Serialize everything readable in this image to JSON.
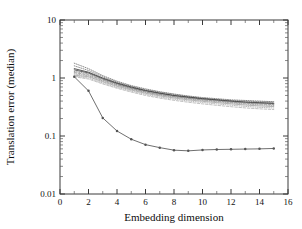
{
  "figure": {
    "background": "#ffffff",
    "frame_color": "#3a3a3a"
  },
  "chart_data": {
    "type": "line",
    "title": "",
    "subtitle": "",
    "xlabel": "Embedding dimension",
    "ylabel": "Translation error (median)",
    "xscale": "linear",
    "yscale": "log",
    "xlim": [
      0,
      16
    ],
    "ylim": [
      0.01,
      10
    ],
    "xticks": [
      0,
      2,
      4,
      6,
      8,
      10,
      12,
      14,
      16
    ],
    "xticklabels": [
      "0",
      "2",
      "4",
      "6",
      "8",
      "10",
      "12",
      "14",
      "16"
    ],
    "yticks": [
      0.01,
      0.1,
      1,
      10
    ],
    "yticklabels": [
      "0.01",
      "0.1",
      "1",
      "10"
    ],
    "grid": false,
    "legend": "none",
    "x": [
      1,
      2,
      3,
      4,
      5,
      6,
      7,
      8,
      9,
      10,
      11,
      12,
      13,
      14,
      15
    ],
    "series": [
      {
        "name": "baseline-1",
        "style": "dotted",
        "color": "#6e6e6e",
        "values": [
          1.8,
          1.45,
          1.1,
          0.88,
          0.74,
          0.65,
          0.58,
          0.53,
          0.49,
          0.46,
          0.44,
          0.42,
          0.41,
          0.4,
          0.39
        ]
      },
      {
        "name": "baseline-2",
        "style": "dotted",
        "color": "#757575",
        "values": [
          1.62,
          1.35,
          1.05,
          0.85,
          0.72,
          0.63,
          0.57,
          0.52,
          0.48,
          0.45,
          0.43,
          0.41,
          0.4,
          0.39,
          0.385
        ]
      },
      {
        "name": "baseline-3",
        "style": "solid",
        "color": "#2e2e2e",
        "values": [
          1.45,
          1.26,
          1.0,
          0.82,
          0.7,
          0.61,
          0.55,
          0.5,
          0.47,
          0.44,
          0.42,
          0.4,
          0.385,
          0.375,
          0.368
        ]
      },
      {
        "name": "baseline-4",
        "style": "solid",
        "color": "#3c3c3c",
        "values": [
          1.38,
          1.22,
          0.97,
          0.8,
          0.68,
          0.6,
          0.54,
          0.495,
          0.46,
          0.435,
          0.415,
          0.395,
          0.38,
          0.37,
          0.362
        ]
      },
      {
        "name": "baseline-5",
        "style": "dotted",
        "color": "#808080",
        "values": [
          1.3,
          1.18,
          0.95,
          0.78,
          0.665,
          0.585,
          0.525,
          0.485,
          0.452,
          0.428,
          0.408,
          0.39,
          0.375,
          0.365,
          0.357
        ]
      },
      {
        "name": "baseline-6",
        "style": "dashed",
        "color": "#8a8a8a",
        "values": [
          1.24,
          1.13,
          0.92,
          0.765,
          0.655,
          0.575,
          0.518,
          0.478,
          0.445,
          0.42,
          0.4,
          0.382,
          0.368,
          0.356,
          0.348
        ]
      },
      {
        "name": "baseline-7",
        "style": "dotted",
        "color": "#949494",
        "values": [
          1.18,
          1.09,
          0.89,
          0.745,
          0.64,
          0.563,
          0.508,
          0.468,
          0.435,
          0.41,
          0.39,
          0.372,
          0.356,
          0.344,
          0.336
        ]
      },
      {
        "name": "baseline-8",
        "style": "solid",
        "color": "#9e9e9e",
        "values": [
          1.12,
          1.05,
          0.86,
          0.72,
          0.62,
          0.545,
          0.492,
          0.452,
          0.42,
          0.396,
          0.376,
          0.358,
          0.342,
          0.33,
          0.322
        ]
      },
      {
        "name": "baseline-9",
        "style": "dotted",
        "color": "#a8a8a8",
        "values": [
          1.08,
          1.0,
          0.82,
          0.69,
          0.595,
          0.522,
          0.47,
          0.432,
          0.402,
          0.378,
          0.358,
          0.34,
          0.324,
          0.312,
          0.304
        ]
      },
      {
        "name": "baseline-10",
        "style": "dashed",
        "color": "#b2b2b2",
        "values": [
          1.05,
          0.96,
          0.79,
          0.665,
          0.572,
          0.5,
          0.45,
          0.412,
          0.382,
          0.358,
          0.338,
          0.32,
          0.305,
          0.294,
          0.286
        ]
      },
      {
        "name": "proposed",
        "style": "solid-markers",
        "color": "#555555",
        "marker": "dot",
        "values": [
          1.05,
          0.6,
          0.205,
          0.122,
          0.088,
          0.071,
          0.063,
          0.057,
          0.0555,
          0.0575,
          0.0585,
          0.059,
          0.0595,
          0.06,
          0.061
        ]
      }
    ]
  }
}
